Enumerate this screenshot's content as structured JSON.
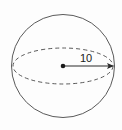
{
  "figure": {
    "name": "sphere-with-radius",
    "background_color": "#fdfdfd",
    "stroke_color": "#5a5a5a",
    "label_color": "#1a1a1a"
  },
  "labels": {
    "radius_value": "10"
  },
  "icons": {
    "center_point": "center-dot-icon",
    "arrow_tip": "arrow-head-icon"
  },
  "geometry": {
    "circle": {
      "cx": 63,
      "cy": 66,
      "r": 51.5
    },
    "equator": {
      "cx": 63,
      "cy": 66,
      "rx": 50,
      "ry": 18
    },
    "radius_arrow": {
      "x1": 63,
      "y1": 66,
      "x2": 114,
      "y2": 66
    }
  }
}
